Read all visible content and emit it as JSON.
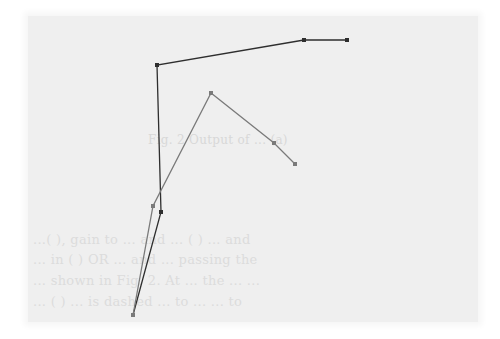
{
  "page": {
    "background": "#efefef",
    "caption": "Fig. 2  Output of ... (a)",
    "text_lines": [
      "",
      "...(  ), gain to ... and ... ( ) ... and",
      "... in ( ) OR ... and ... passing the",
      "... shown in Fig. 2. At ... the ... ...",
      "... (  ) ... is dashed ... to ... ... to"
    ]
  },
  "polylines": [
    {
      "name": "dark-polyline",
      "color": "#2e2e2e",
      "points": [
        [
          133,
          315
        ],
        [
          161,
          212
        ],
        [
          157,
          65
        ],
        [
          304,
          40
        ],
        [
          347,
          40
        ]
      ]
    },
    {
      "name": "gray-polyline",
      "color": "#7a7a7a",
      "points": [
        [
          133,
          315
        ],
        [
          153,
          206
        ],
        [
          211,
          93
        ],
        [
          274,
          143
        ],
        [
          295,
          164
        ]
      ]
    }
  ]
}
